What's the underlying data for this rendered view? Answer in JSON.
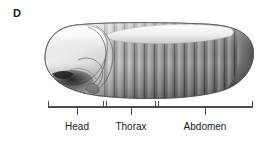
{
  "figure": {
    "panel_letter": "D",
    "background_color": "#ffffff",
    "width": 279,
    "height": 144
  },
  "embryo": {
    "description": "Lateral view of a segmented insect (Drosophila) embryo, anterior to the left, posterior to the right",
    "orientation": "anterior-left",
    "outline_color": "#4a4a4a",
    "anterior_tip_x": 45,
    "posterior_tip_x": 253,
    "dorsal_y": 26,
    "ventral_y": 96,
    "anterior_tone": "#f4f4f2",
    "posterior_tone": "#575757",
    "midbody_tone": "#8d8d8d",
    "dorsal_band_tone": "#e8e8e6",
    "segment_count": 14,
    "head_lobe_count": 4
  },
  "axis": {
    "bracket_color": "#4d4d4d",
    "bracket_line_y": 107,
    "bracket_end_tick_top": 101,
    "bracket_tick_bottom": 114,
    "start_x": 48,
    "end_x": 253,
    "dividers": [
      {
        "name": "head-thorax-divider",
        "x": 104
      },
      {
        "name": "thorax-abdomen-divider",
        "x": 156
      }
    ],
    "regions": [
      {
        "key": "head",
        "label": "Head",
        "start_x": 48,
        "end_x": 104,
        "tick_x": 77,
        "label_x": 77,
        "label_y": 126
      },
      {
        "key": "thorax",
        "label": "Thorax",
        "start_x": 106,
        "end_x": 155,
        "tick_x": 131,
        "label_x": 131,
        "label_y": 126
      },
      {
        "key": "abdomen",
        "label": "Abdomen",
        "start_x": 158,
        "end_x": 253,
        "tick_x": 205,
        "label_x": 205,
        "label_y": 126
      }
    ]
  }
}
